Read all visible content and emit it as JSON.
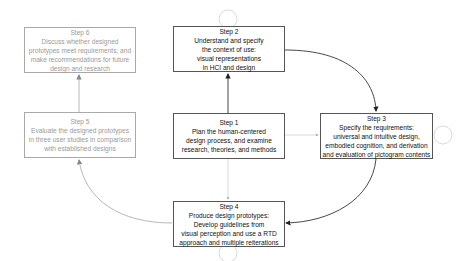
{
  "diagram": {
    "type": "process-flow",
    "colors": {
      "active_border": "#555555",
      "faded_border": "#a9a9a9",
      "faded_text": "#9a9a9a",
      "text": "#111111",
      "arrow": "#333333",
      "faded_arrow": "#b0b0b0"
    },
    "steps": [
      {
        "id": "step1",
        "title": "Step 1",
        "lines": [
          "Plan the human-centered",
          "design process, and examine",
          "research, theories, and methods"
        ],
        "state": "active"
      },
      {
        "id": "step2",
        "title": "Step 2",
        "lines": [
          "Understand and specify",
          "the context of use:",
          "visual representations",
          "in HCI and design"
        ],
        "state": "active"
      },
      {
        "id": "step3",
        "title": "Step 3",
        "lines": [
          "Specify the requirements:",
          "universal and intuitive design,",
          "embodied cognition, and derivation",
          "and evaluation of pictogram contents"
        ],
        "state": "active"
      },
      {
        "id": "step4",
        "title": "Step 4",
        "lines": [
          "Produce design prototypes:",
          "Develop guidelines from",
          "visual perception and use a RTD",
          "approach and multiple reiterations"
        ],
        "state": "active"
      },
      {
        "id": "step5",
        "title": "Step 5",
        "lines": [
          "Evaluate the designed prototypes",
          "in three user studies in comparison",
          "with established designs"
        ],
        "state": "faded"
      },
      {
        "id": "step6",
        "title": "Step 6",
        "lines": [
          "Discuss whether designed",
          "prototypes meet requirements, and",
          "make recommendations for future",
          "design and research"
        ],
        "state": "faded"
      }
    ],
    "edges": [
      {
        "from": "step1",
        "to": "step2",
        "style": "solid"
      },
      {
        "from": "step2",
        "to": "step3",
        "style": "solid-curved"
      },
      {
        "from": "step3",
        "to": "step4",
        "style": "solid-curved"
      },
      {
        "from": "step4",
        "to": "step5",
        "style": "faded-curved"
      },
      {
        "from": "step5",
        "to": "step6",
        "style": "faded"
      },
      {
        "from": "step1",
        "to": "step3",
        "style": "faded-dashed"
      },
      {
        "from": "step1",
        "to": "step4",
        "style": "faded-dashed"
      },
      {
        "from": "step2",
        "to": "step2",
        "style": "self-loop"
      },
      {
        "from": "step3",
        "to": "step3",
        "style": "self-loop"
      },
      {
        "from": "step4",
        "to": "step4",
        "style": "self-loop"
      }
    ]
  }
}
